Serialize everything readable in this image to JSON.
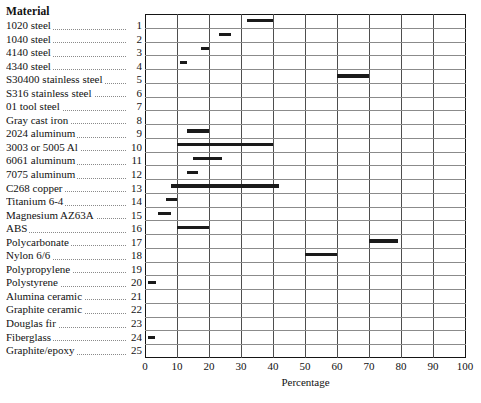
{
  "legend": {
    "title": "Material",
    "rows": [
      {
        "name": "1020 steel",
        "index": "1"
      },
      {
        "name": "1040 steel",
        "index": "2"
      },
      {
        "name": "4140 steel",
        "index": "3"
      },
      {
        "name": "4340 steel",
        "index": "4"
      },
      {
        "name": "S30400 stainless steel",
        "index": "5"
      },
      {
        "name": "S316 stainless steel",
        "index": "6"
      },
      {
        "name": "01 tool steel",
        "index": "7"
      },
      {
        "name": "Gray cast iron",
        "index": "8"
      },
      {
        "name": "2024 aluminum",
        "index": "9"
      },
      {
        "name": "3003 or 5005 Al",
        "index": "10"
      },
      {
        "name": "6061 aluminum",
        "index": "11"
      },
      {
        "name": "7075 aluminum",
        "index": "12"
      },
      {
        "name": "C268 copper",
        "index": "13"
      },
      {
        "name": "Titanium 6-4",
        "index": "14"
      },
      {
        "name": "Magnesium AZ63A",
        "index": "15"
      },
      {
        "name": "ABS",
        "index": "16"
      },
      {
        "name": "Polycarbonate",
        "index": "17"
      },
      {
        "name": "Nylon 6/6",
        "index": "18"
      },
      {
        "name": "Polypropylene",
        "index": "19"
      },
      {
        "name": "Polystyrene",
        "index": "20"
      },
      {
        "name": "Alumina ceramic",
        "index": "21"
      },
      {
        "name": "Graphite ceramic",
        "index": "22"
      },
      {
        "name": "Douglas fir",
        "index": "23"
      },
      {
        "name": "Fiberglass",
        "index": "24"
      },
      {
        "name": "Graphite/epoxy",
        "index": "25"
      }
    ]
  },
  "chart_data": {
    "type": "bar",
    "orientation": "horizontal-range",
    "title": "",
    "xlabel": "Percentage",
    "ylabel": "",
    "xlim": [
      0,
      100
    ],
    "xticks": [
      0,
      10,
      20,
      30,
      40,
      50,
      60,
      70,
      80,
      90,
      100
    ],
    "grid": "both",
    "legend_position": "left-outside",
    "bar_color": "#1a1a1a",
    "categories": [
      "1020 steel",
      "1040 steel",
      "4140 steel",
      "4340 steel",
      "S30400 stainless steel",
      "S316 stainless steel",
      "01 tool steel",
      "Gray cast iron",
      "2024 aluminum",
      "3003 or 5005 Al",
      "6061 aluminum",
      "7075 aluminum",
      "C268 copper",
      "Titanium 6-4",
      "Magnesium AZ63A",
      "ABS",
      "Polycarbonate",
      "Nylon 6/6",
      "Polypropylene",
      "Polystyrene",
      "Alumina ceramic",
      "Graphite ceramic",
      "Douglas fir",
      "Fiberglass",
      "Graphite/epoxy"
    ],
    "ranges": [
      {
        "category": "1020 steel",
        "start": 32,
        "end": 40
      },
      {
        "category": "1040 steel",
        "start": 23,
        "end": 27
      },
      {
        "category": "4140 steel",
        "start": 17.5,
        "end": 20
      },
      {
        "category": "4340 steel",
        "start": 11,
        "end": 13
      },
      {
        "category": "S30400 stainless steel",
        "start": 60,
        "end": 70
      },
      {
        "category": "S316 stainless steel",
        "start": null,
        "end": null
      },
      {
        "category": "01 tool steel",
        "start": null,
        "end": null
      },
      {
        "category": "Gray cast iron",
        "start": null,
        "end": null
      },
      {
        "category": "2024 aluminum",
        "start": 13,
        "end": 20
      },
      {
        "category": "3003 or 5005 Al",
        "start": 10,
        "end": 40
      },
      {
        "category": "6061 aluminum",
        "start": 15,
        "end": 24
      },
      {
        "category": "7075 aluminum",
        "start": 13,
        "end": 16.5
      },
      {
        "category": "C268 copper",
        "start": 8,
        "end": 42
      },
      {
        "category": "Titanium 6-4",
        "start": 6.5,
        "end": 10
      },
      {
        "category": "Magnesium AZ63A",
        "start": 4,
        "end": 8
      },
      {
        "category": "ABS",
        "start": 10,
        "end": 20
      },
      {
        "category": "Polycarbonate",
        "start": 70,
        "end": 79
      },
      {
        "category": "Nylon 6/6",
        "start": 50,
        "end": 60
      },
      {
        "category": "Polypropylene",
        "start": null,
        "end": null
      },
      {
        "category": "Polystyrene",
        "start": 1,
        "end": 3.5
      },
      {
        "category": "Alumina ceramic",
        "start": null,
        "end": null
      },
      {
        "category": "Graphite ceramic",
        "start": null,
        "end": null
      },
      {
        "category": "Douglas fir",
        "start": null,
        "end": null
      },
      {
        "category": "Fiberglass",
        "start": 1,
        "end": 3
      },
      {
        "category": "Graphite/epoxy",
        "start": null,
        "end": null
      }
    ]
  }
}
